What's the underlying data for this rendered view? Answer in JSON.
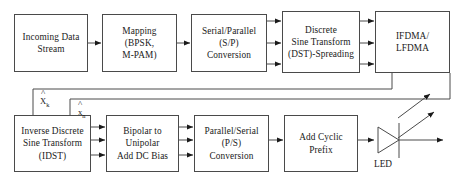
{
  "diagram": {
    "type": "block-diagram",
    "stroke_color": "#4a4a4a",
    "text_color": "#1a1a1a",
    "background": "#ffffff"
  },
  "blocks": [
    {
      "id": "incoming-data-stream",
      "lines": [
        "Incoming Data",
        "Stream"
      ],
      "row": "top",
      "order": 1
    },
    {
      "id": "mapping",
      "lines": [
        "Mapping",
        "(BPSK,",
        "M-PAM)"
      ],
      "row": "top",
      "order": 2
    },
    {
      "id": "serial-parallel-conversion",
      "lines": [
        "Serial/Parallel",
        "(S/P)",
        "Conversion"
      ],
      "row": "top",
      "order": 3
    },
    {
      "id": "discrete-sine-transform",
      "lines": [
        "Discrete",
        "Sine Transform",
        "(DST)-Spreading"
      ],
      "row": "top",
      "order": 4
    },
    {
      "id": "ifdma-lfdma",
      "lines": [
        "IFDMA/",
        "LFDMA"
      ],
      "row": "top",
      "order": 5
    },
    {
      "id": "inverse-discrete-sine-transform",
      "lines": [
        "Inverse Discrete",
        "Sine Transform",
        "(IDST)"
      ],
      "row": "bottom",
      "order": 1
    },
    {
      "id": "bipolar-to-unipolar",
      "lines": [
        "Bipolar to",
        "Unipolar",
        "Add DC Bias"
      ],
      "row": "bottom",
      "order": 2
    },
    {
      "id": "parallel-serial-conversion",
      "lines": [
        "Parallel/Serial",
        "(P/S)",
        "Conversion"
      ],
      "row": "bottom",
      "order": 3
    },
    {
      "id": "add-cyclic-prefix",
      "lines": [
        "Add Cyclic",
        "Prefix"
      ],
      "row": "bottom",
      "order": 4
    }
  ],
  "signal_labels": {
    "feedback_upper": {
      "base": "X",
      "subscript": "k",
      "accent": "hat"
    },
    "feedback_lower": {
      "base": "x",
      "subscript": "n",
      "accent": "hat"
    }
  },
  "components": {
    "led": {
      "label": "LED",
      "symbol": "light-emitting-diode"
    }
  }
}
